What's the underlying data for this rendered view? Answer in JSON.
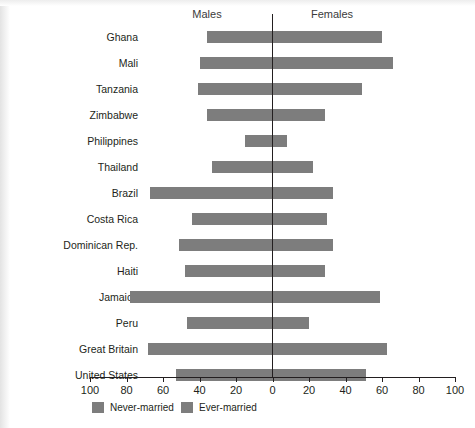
{
  "headers": {
    "left": "Males",
    "right": "Females"
  },
  "legend": {
    "items": [
      {
        "label": "Never-married",
        "color": "#7d7d7d"
      },
      {
        "label": "Ever-married",
        "color": "#7d7d7d"
      }
    ]
  },
  "axis": {
    "tick_labels": [
      "100",
      "80",
      "60",
      "40",
      "20",
      "0",
      "20",
      "40",
      "60",
      "80",
      "100"
    ],
    "tick_values": [
      -100,
      -80,
      -60,
      -40,
      -20,
      0,
      20,
      40,
      60,
      80,
      100
    ],
    "min": -100,
    "max": 100
  },
  "chart_data": {
    "type": "bar",
    "orientation": "horizontal",
    "subtype": "diverging-population-pyramid",
    "title": "",
    "subtitle": "",
    "xlabel": "",
    "ylabel": "",
    "xlim": [
      -100,
      100
    ],
    "grid": false,
    "legend_position": "bottom-left",
    "axis_tick_labels": [
      "100",
      "80",
      "60",
      "40",
      "20",
      "0",
      "20",
      "40",
      "60",
      "80",
      "100"
    ],
    "left_side_label": "Males",
    "right_side_label": "Females",
    "series": [
      {
        "name": "Never-married",
        "side": "Males",
        "color": "#7d7d7d"
      },
      {
        "name": "Ever-married",
        "side": "Females",
        "color": "#7d7d7d"
      }
    ],
    "categories": [
      "Ghana",
      "Mali",
      "Tanzania",
      "Zimbabwe",
      "Philippines",
      "Thailand",
      "Brazil",
      "Costa Rica",
      "Dominican Rep.",
      "Haiti",
      "Jamaica",
      "Peru",
      "Great Britain",
      "United States"
    ],
    "males": [
      36,
      40,
      41,
      36,
      15,
      33,
      67,
      44,
      51,
      48,
      78,
      47,
      68,
      53
    ],
    "females": [
      60,
      66,
      49,
      29,
      8,
      22,
      33,
      30,
      33,
      29,
      59,
      20,
      63,
      51
    ]
  },
  "categories": [
    {
      "label": "Ghana",
      "males": 36,
      "females": 60,
      "row_top": 31
    },
    {
      "label": "Mali",
      "males": 40,
      "females": 66,
      "row_top": 57
    },
    {
      "label": "Tanzania",
      "males": 41,
      "females": 49,
      "row_top": 83
    },
    {
      "label": "Zimbabwe",
      "males": 36,
      "females": 29,
      "row_top": 109
    },
    {
      "label": "Philippines",
      "males": 15,
      "females": 8,
      "row_top": 135
    },
    {
      "label": "Thailand",
      "males": 33,
      "females": 22,
      "row_top": 161
    },
    {
      "label": "Brazil",
      "males": 67,
      "females": 33,
      "row_top": 187
    },
    {
      "label": "Costa Rica",
      "males": 44,
      "females": 30,
      "row_top": 213
    },
    {
      "label": "Dominican Rep.",
      "males": 51,
      "females": 33,
      "row_top": 239
    },
    {
      "label": "Haiti",
      "males": 48,
      "females": 29,
      "row_top": 265
    },
    {
      "label": "Jamaica",
      "males": 78,
      "females": 59,
      "row_top": 291
    },
    {
      "label": "Peru",
      "males": 47,
      "females": 20,
      "row_top": 317
    },
    {
      "label": "Great Britain",
      "males": 68,
      "females": 63,
      "row_top": 343
    },
    {
      "label": "United States",
      "males": 53,
      "females": 51,
      "row_top": 369
    }
  ]
}
